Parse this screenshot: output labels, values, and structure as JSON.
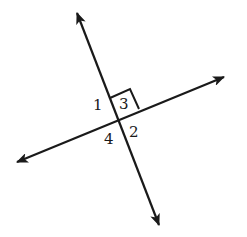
{
  "diagram": {
    "type": "perpendicular-lines",
    "stroke_color": "#1a1a1a",
    "background": "#ffffff",
    "lines": [
      {
        "name": "line-a",
        "from": [
          159,
          225
        ],
        "to": [
          77,
          13
        ],
        "arrows": "both"
      },
      {
        "name": "line-b",
        "from": [
          17,
          162
        ],
        "to": [
          224,
          77
        ],
        "arrows": "both"
      }
    ],
    "intersection": [
      118,
      119
    ],
    "right_angle_marker": {
      "angle": "3"
    },
    "angle_labels": [
      {
        "id": "1",
        "text": "1",
        "x": 93,
        "y": 110
      },
      {
        "id": "2",
        "text": "2",
        "x": 129,
        "y": 137
      },
      {
        "id": "3",
        "text": "3",
        "x": 119,
        "y": 109
      },
      {
        "id": "4",
        "text": "4",
        "x": 104,
        "y": 144
      }
    ]
  }
}
